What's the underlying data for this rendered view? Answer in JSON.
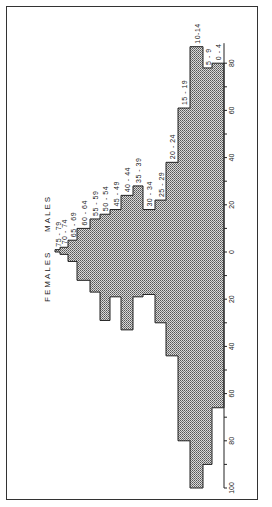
{
  "chart_data": {
    "type": "bar",
    "subtype": "population-pyramid (rotated 90° counter-clockwise)",
    "title": "",
    "xlabel": "",
    "ylabel": "",
    "legend": [
      "MALES",
      "FEMALES"
    ],
    "categories": [
      "0-4",
      "5-9",
      "10-14",
      "15-19",
      "20-24",
      "25-29",
      "30-34",
      "35-39",
      "40-44",
      "45-49",
      "50-54",
      "55-59",
      "60-64",
      "65-69",
      "70-74",
      "75-79"
    ],
    "series": [
      {
        "name": "FEMALES",
        "values": [
          80,
          78,
          87,
          61,
          38,
          22,
          18,
          28,
          24,
          18,
          16,
          14,
          10,
          5,
          2,
          1
        ]
      },
      {
        "name": "MALES",
        "values": [
          66,
          90,
          100,
          80,
          44,
          30,
          18,
          19,
          33,
          19,
          29,
          17,
          12,
          4,
          1,
          0
        ]
      }
    ],
    "axis": {
      "ticks_females": [
        80,
        60,
        40,
        20,
        0
      ],
      "ticks_males": [
        20,
        40,
        60,
        80,
        100
      ],
      "tick_labels": [
        "80",
        "60",
        "40",
        "20",
        "0",
        "20",
        "40",
        "60",
        "80",
        "100"
      ],
      "range_females": [
        0,
        90
      ],
      "range_males": [
        0,
        100
      ]
    },
    "grid": false
  },
  "labels": {
    "males": "MALES",
    "females": "FEMALES",
    "ages": [
      "0 - 4",
      "5 - 9",
      "10-14",
      "15 - 19",
      "20 - 24",
      "25 - 29",
      "30 - 34",
      "35 - 39",
      "40 - 44",
      "45 - 49",
      "50 - 54",
      "55 - 59",
      "60 - 64",
      "65 - 69",
      "70 - 74",
      "75 - 79"
    ],
    "ticks": [
      "80",
      "60",
      "40",
      "20",
      "0",
      "20",
      "40",
      "60",
      "80",
      "100"
    ]
  }
}
